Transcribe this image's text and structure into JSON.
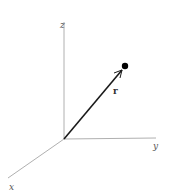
{
  "diagram": {
    "type": "3d-coordinate-axes-with-position-vector",
    "axes": {
      "z": {
        "label": "z"
      },
      "y": {
        "label": "y"
      },
      "x": {
        "label": "x"
      }
    },
    "vector": {
      "label": "r"
    },
    "colors": {
      "axis": "#b0b0b0",
      "vector": "#1a1a1a",
      "point": "#000000"
    }
  }
}
